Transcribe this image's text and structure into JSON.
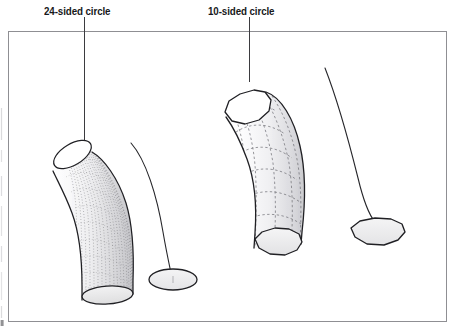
{
  "figure": {
    "background_color": "#ffffff",
    "ink_color": "#1d1d1f",
    "frame": {
      "x": 8,
      "y": 31,
      "width": 439,
      "height": 291,
      "stroke_color": "#8b8b8f",
      "stroke_width": 1
    },
    "scan_artifact": {
      "description": "faint vertical dotted scan edge at far left of page",
      "x": 1,
      "color": "#b9b9bd"
    }
  },
  "callouts": [
    {
      "id": "callout-24",
      "label": "24-sided circle",
      "leader": {
        "x": 84,
        "y_start": 17,
        "y_end": 148
      },
      "describes": "left tube, smooth 24-segment circular profile"
    },
    {
      "id": "callout-10",
      "label": "10-sided circle",
      "leader": {
        "x": 249,
        "y_start": 17,
        "y_end": 82
      },
      "describes": "right tube, faceted 10-segment circular profile"
    }
  ],
  "objects": [
    {
      "id": "tube-24-sided",
      "name": "24-sided extruded tube",
      "sides": 24,
      "appearance": "smooth curved cylinder with dense dotted longitudinal isoparms",
      "fill_color": "#f4f4f5",
      "shade_color": "#d2d2d4",
      "cap_top_fill": "#ffffff",
      "cap_bottom_fill": "#e6e6e8"
    },
    {
      "id": "tube-10-sided",
      "name": "10-sided extruded tube",
      "sides": 10,
      "appearance": "faceted curved cylinder with visible dashed segment edges",
      "fill_color": "#f7f7f8",
      "shade_color": "#d8d8da",
      "cap_top_fill": "#ffffff",
      "cap_bottom_fill": "#ececee"
    },
    {
      "id": "profile-24-sided",
      "name": "24-sided circle profile on ground",
      "sides": 24,
      "appearance": "smooth flat ellipse",
      "fill_color": "#efeff0"
    },
    {
      "id": "profile-10-sided",
      "name": "10-sided circle profile on ground",
      "sides": 10,
      "appearance": "flat decagon with visible straight facets",
      "fill_color": "#eaeaec"
    },
    {
      "id": "path-curve-left",
      "name": "extrusion path curve (left)",
      "appearance": "thin freeform curve from upper area down to left profile"
    },
    {
      "id": "path-curve-right",
      "name": "extrusion path curve (right)",
      "appearance": "thin freeform curve from upper area down to right profile"
    }
  ]
}
